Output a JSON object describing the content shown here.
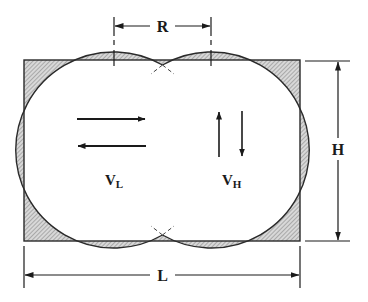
{
  "diagram": {
    "labels": {
      "R": "R",
      "H": "H",
      "L": "L",
      "VL_main": "V",
      "VL_sub": "L",
      "VH_main": "V",
      "VH_sub": "H"
    },
    "colors": {
      "stroke": "#2a2a2a",
      "hatch": "#8a8a8a",
      "background": "#ffffff"
    },
    "dimensions": {
      "rect": {
        "x": 24,
        "y": 60,
        "width": 276,
        "height": 181
      },
      "circle_left": {
        "cx": 114,
        "cy": 150,
        "r": 98
      },
      "circle_right": {
        "cx": 211,
        "cy": 150,
        "r": 98
      }
    },
    "arrows": {
      "horizontal": [
        "right",
        "left"
      ],
      "vertical": [
        "up",
        "down"
      ]
    }
  }
}
